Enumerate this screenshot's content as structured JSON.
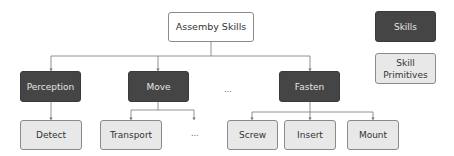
{
  "diagram": {
    "root": {
      "label": "Assemby Skills"
    },
    "skills": [
      {
        "label": "Perception"
      },
      {
        "label": "Move"
      },
      {
        "label": "Fasten"
      }
    ],
    "skills_ellipsis": "...",
    "primitives": {
      "perception": [
        {
          "label": "Detect"
        }
      ],
      "move": [
        {
          "label": "Transport"
        }
      ],
      "move_ellipsis": "...",
      "fasten": [
        {
          "label": "Screw"
        },
        {
          "label": "Insert"
        },
        {
          "label": "Mount"
        }
      ]
    }
  },
  "legend": {
    "skills": "Skills",
    "primitives": "Skill Primitives"
  },
  "colors": {
    "skill_fill": "#454545",
    "primitive_fill": "#e8e8e8",
    "edge": "#777777"
  }
}
